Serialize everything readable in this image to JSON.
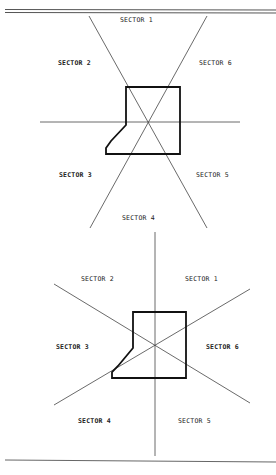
{
  "diagrams": [
    {
      "id": "top",
      "description": "Sector diagram with sector boundaries along diagonals and horizontal",
      "labels": [
        {
          "text": "SECTOR 1",
          "x": 120,
          "y": 19
        },
        {
          "text": "SECTOR 2",
          "x": 58,
          "y": 62
        },
        {
          "text": "SECTOR 6",
          "x": 199,
          "y": 62
        },
        {
          "text": "SECTOR 3",
          "x": 59,
          "y": 173
        },
        {
          "text": "SECTOR 5",
          "x": 196,
          "y": 173
        },
        {
          "text": "SECTOR 4",
          "x": 122,
          "y": 216
        }
      ]
    },
    {
      "id": "bottom",
      "description": "Sector diagram with sector boundaries along vertical and diagonals",
      "labels": [
        {
          "text": "SECTOR 2",
          "x": 81,
          "y": 277
        },
        {
          "text": "SECTOR 1",
          "x": 185,
          "y": 277
        },
        {
          "text": "SECTOR 3",
          "x": 56,
          "y": 345
        },
        {
          "text": "SECTOR 6",
          "x": 206,
          "y": 345
        },
        {
          "text": "SECTOR 4",
          "x": 78,
          "y": 419
        },
        {
          "text": "SECTOR 5",
          "x": 178,
          "y": 419
        }
      ]
    }
  ],
  "colors": {
    "line": "#333333",
    "outline": "#111111",
    "background": "#ffffff"
  }
}
